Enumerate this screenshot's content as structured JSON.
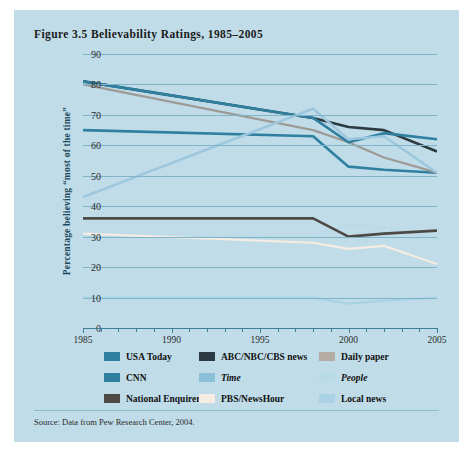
{
  "figure": {
    "number": "Figure 3.5",
    "title": "Figure 3.5 Believability Ratings, 1985–2005",
    "title_label": "Believability Ratings, 1985–2005",
    "source": "Source: Data from Pew Research Center, 2004.",
    "background_color": "#c0dce8",
    "grid_color": "#7fb4c9",
    "axis_color": "#3f7e99"
  },
  "chart_data": {
    "type": "line",
    "title": "Figure 3.5 Believability Ratings, 1985–2005",
    "xlabel": "",
    "ylabel": "Percentage believing “most of the time”",
    "xlim": [
      1985,
      2005
    ],
    "ylim": [
      0,
      90
    ],
    "ytick_values": [
      0,
      10,
      20,
      30,
      40,
      50,
      60,
      70,
      80,
      90
    ],
    "ytick_labels": [
      "0",
      "10",
      "20",
      "30",
      "40",
      "50",
      "60",
      "70",
      "80",
      "90"
    ],
    "xtick_values": [
      1985,
      1990,
      1995,
      2000,
      2005
    ],
    "xtick_labels": [
      "1985",
      "1990",
      "1995",
      "2000",
      "2005"
    ],
    "xtick_minor_step": 1,
    "grid": "horizontal",
    "legend_position": "below-axes",
    "legend_columns": 3,
    "series": [
      {
        "name": "USA Today",
        "color": "#2e7fa0",
        "width": 2.6,
        "italic": false,
        "x": [
          1985,
          1998,
          2000,
          2002,
          2005
        ],
        "y": [
          65,
          63,
          53,
          52,
          51
        ]
      },
      {
        "name": "ABC/NBC/CBS news",
        "color": "#2c3a41",
        "width": 2.6,
        "italic": false,
        "x": [
          1985,
          1998,
          2000,
          2002,
          2005
        ],
        "y": [
          81,
          69,
          66,
          65,
          58
        ]
      },
      {
        "name": "Daily paper",
        "color": "#9d9a96",
        "width": 2.2,
        "italic": false,
        "x": [
          1985,
          1998,
          2000,
          2002,
          2005
        ],
        "y": [
          80,
          65,
          61,
          56,
          51
        ]
      },
      {
        "name": "CNN",
        "color": "#2e7fa0",
        "width": 2.6,
        "italic": false,
        "x": [
          1985,
          1998,
          2000,
          2002,
          2005
        ],
        "y": [
          81,
          69,
          61,
          64,
          62
        ]
      },
      {
        "name": "Time",
        "color": "#9cc7de",
        "width": 2.6,
        "italic": true,
        "x": [
          1985,
          1998,
          2000,
          2002,
          2005
        ],
        "y": [
          43,
          72,
          62,
          63,
          51
        ]
      },
      {
        "name": "People",
        "color": "#b9dbe8",
        "width": 2.2,
        "italic": true,
        "x": [
          1985,
          1998,
          2000,
          2002,
          2005
        ],
        "y": [
          30,
          30,
          34,
          33,
          30
        ]
      },
      {
        "name": "National Enquirer",
        "color": "#4d4a46",
        "width": 2.6,
        "italic": false,
        "x": [
          1985,
          1998,
          2000,
          2002,
          2005
        ],
        "y": [
          36,
          36,
          30,
          31,
          32
        ]
      },
      {
        "name": "PBS/NewsHour",
        "color": "#f6ece2",
        "width": 2.2,
        "italic": false,
        "x": [
          1985,
          1998,
          2000,
          2002,
          2005
        ],
        "y": [
          31,
          28,
          26,
          27,
          21
        ]
      },
      {
        "name": "Local news",
        "color": "#a9d3e4",
        "width": 2.2,
        "italic": false,
        "x": [
          1985,
          1998,
          2000,
          2002,
          2005
        ],
        "y": [
          10,
          10,
          8,
          9,
          10
        ]
      }
    ]
  },
  "legend": {
    "items": [
      {
        "label": "USA Today",
        "color": "#2e7fa0",
        "italic": false
      },
      {
        "label": "ABC/NBC/CBS news",
        "color": "#2c3a41",
        "italic": false
      },
      {
        "label": "Daily paper",
        "color": "#b3aba4",
        "italic": false
      },
      {
        "label": "CNN",
        "color": "#2e7fa0",
        "italic": false
      },
      {
        "label": "Time",
        "color": "#8cc0d9",
        "italic": true
      },
      {
        "label": "People",
        "color": "#b9dbe8",
        "italic": true
      },
      {
        "label": "National Enquirer",
        "color": "#4d4a46",
        "italic": false
      },
      {
        "label": "PBS/NewsHour",
        "color": "#f6ece2",
        "italic": false
      },
      {
        "label": "Local news",
        "color": "#a9d3e4",
        "italic": false
      }
    ]
  }
}
